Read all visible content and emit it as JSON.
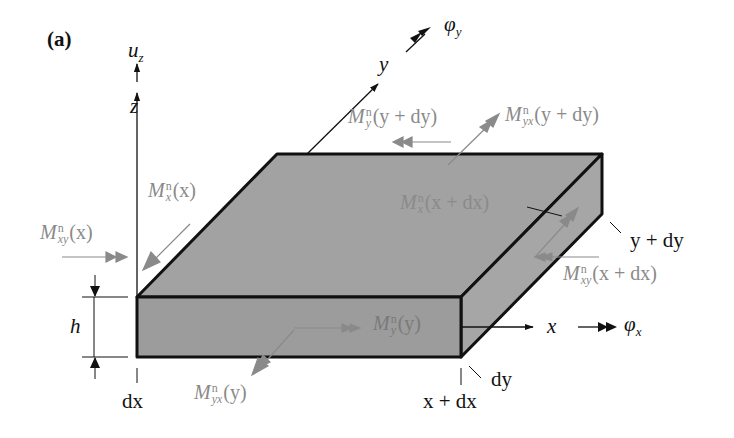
{
  "figure": {
    "panel_label": "(a)",
    "colors": {
      "plate_fill": "#9e9e9e",
      "outline": "#111111",
      "moment_arrow": "#8a8a8a",
      "axis": "#111111"
    }
  },
  "axes": {
    "z": "z",
    "uz": {
      "base": "u",
      "sub": "z"
    },
    "y": "y",
    "phi_y": {
      "base": "φ",
      "sub": "y"
    },
    "x": "x",
    "phi_x": {
      "base": "φ",
      "sub": "x"
    }
  },
  "dimensions": {
    "h": "h",
    "dx": "dx",
    "dy": "dy",
    "x_plus_dx": "x + dx",
    "y_plus_dy": "y + dy"
  },
  "moments": {
    "Mx_x": {
      "base": "M",
      "sup": "n",
      "sub": "x",
      "arg": "(x)"
    },
    "Mxy_x": {
      "base": "M",
      "sup": "n",
      "sub": "xy",
      "arg": "(x)"
    },
    "My_ydy": {
      "base": "M",
      "sup": "n",
      "sub": "y",
      "arg": "(y + dy)"
    },
    "Myx_ydy": {
      "base": "M",
      "sup": "n",
      "sub": "yx",
      "arg": "(y + dy)"
    },
    "Mx_xdx": {
      "base": "M",
      "sup": "n",
      "sub": "x",
      "arg": "(x + dx)"
    },
    "Mxy_xdx": {
      "base": "M",
      "sup": "n",
      "sub": "xy",
      "arg": "(x + dx)"
    },
    "My_y": {
      "base": "M",
      "sup": "n",
      "sub": "y",
      "arg": "(y)"
    },
    "Myx_y": {
      "base": "M",
      "sup": "n",
      "sub": "yx",
      "arg": "(y)"
    }
  }
}
